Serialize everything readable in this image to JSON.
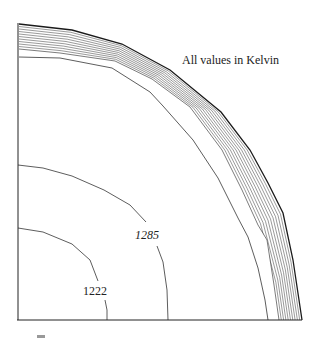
{
  "figure": {
    "annotation": "All values in Kelvin",
    "contour_labels": [
      {
        "id": "c1285",
        "text": "1285",
        "x": 147,
        "y": 239,
        "italic": true
      },
      {
        "id": "c1222",
        "text": "1222",
        "x": 95,
        "y": 295,
        "italic": false
      }
    ],
    "colors": {
      "line": "#333333",
      "outer": "#1a1a1a",
      "hatch": "#555555",
      "background": "#ffffff"
    }
  },
  "chart_data": {
    "type": "contour",
    "title": "",
    "note": "All values in Kelvin",
    "units": "K",
    "contours": [
      {
        "label": "1222",
        "labeled": true
      },
      {
        "label": "1285",
        "labeled": true
      },
      {
        "label": "",
        "labeled": false,
        "description": "unlabeled isotherm just inside the hatched band"
      }
    ],
    "regions": [
      {
        "name": "hatched outer band",
        "description": "densely spaced isotherms near outer boundary"
      }
    ],
    "axes": {
      "left_boundary": true,
      "bottom_boundary": true,
      "ticks": false,
      "grid": false
    }
  }
}
